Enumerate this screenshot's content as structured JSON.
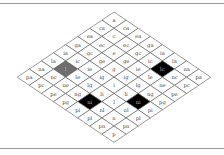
{
  "diagram": {
    "type": "isometric-grid",
    "rows": 8,
    "cols": 8,
    "origin": {
      "x": 114,
      "y": 12
    },
    "step": {
      "dx": 12.1,
      "dy": 8.15
    },
    "colors": {
      "default_fill": "#ffffff",
      "black": "#000000",
      "gray": "#6e6e6e",
      "stroke": "#555555",
      "text": "#444444",
      "text_on_dark": "#bbbbbb"
    },
    "grid": [
      [
        "a",
        "ca",
        "ea",
        "ga",
        "ia",
        "la",
        "na",
        "pa"
      ],
      [
        "ca",
        "c",
        "ec",
        "gc",
        "ic",
        "lc",
        "nc",
        "pc"
      ],
      [
        "ea",
        "ec",
        "e",
        "ge",
        "ie",
        "le",
        "ne",
        "pe"
      ],
      [
        "ga",
        "gc",
        "ge",
        "g",
        "ig",
        "lg",
        "ng",
        "pg"
      ],
      [
        "ia",
        "ic",
        "ie",
        "ig",
        "i",
        "li",
        "ni",
        "pi"
      ],
      [
        "la",
        "l",
        "le",
        "lg",
        "li",
        "l",
        "nl",
        "pl"
      ],
      [
        "na",
        "nc",
        "ne",
        "ng",
        "ni",
        "nl",
        "n",
        "pn"
      ],
      [
        "pa",
        "pc",
        "pe",
        "pg",
        "pi",
        "pl",
        "pn",
        "p"
      ]
    ],
    "highlights": [
      {
        "row": 1,
        "col": 5,
        "fill": "black"
      },
      {
        "row": 5,
        "col": 1,
        "fill": "gray"
      },
      {
        "row": 4,
        "col": 6,
        "fill": "black"
      },
      {
        "row": 6,
        "col": 4,
        "fill": "black"
      }
    ]
  }
}
